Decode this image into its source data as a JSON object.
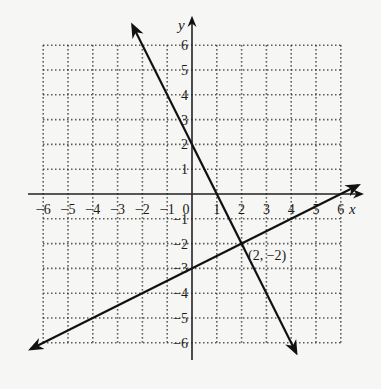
{
  "chart_data": {
    "type": "line",
    "title": "",
    "xlabel": "x",
    "ylabel": "y",
    "xlim": [
      -6,
      6
    ],
    "ylim": [
      -6,
      6
    ],
    "grid": true,
    "grid_style": "dotted",
    "x_ticks": [
      "-6",
      "-5",
      "-4",
      "-3",
      "-2",
      "-1",
      "0",
      "1",
      "2",
      "3",
      "4",
      "5",
      "6"
    ],
    "y_ticks": [
      "-6",
      "-5",
      "-4",
      "-3",
      "-2",
      "-1",
      "1",
      "2",
      "3",
      "4",
      "5",
      "6"
    ],
    "series": [
      {
        "name": "line1",
        "equation": "y = -2x + 2",
        "slope": -2,
        "intercept": 2,
        "x": [
          -1,
          0,
          1,
          2,
          3,
          4
        ],
        "y": [
          4,
          2,
          0,
          -2,
          -4,
          -6
        ]
      },
      {
        "name": "line2",
        "equation": "y = 0.5x - 3",
        "slope": 0.5,
        "intercept": -3,
        "x": [
          -6,
          -4,
          -2,
          0,
          2,
          4,
          6
        ],
        "y": [
          -6,
          -5,
          -4,
          -3,
          -2,
          -1,
          0
        ]
      }
    ],
    "annotations": [
      {
        "text": "(2, −2)",
        "x": 2,
        "y": -2
      }
    ]
  },
  "labels": {
    "x_axis": "x",
    "y_axis": "y",
    "intersection": "(2, −2)",
    "x_ticks": [
      "−6",
      "−5",
      "−4",
      "−3",
      "−2",
      "−1",
      "0",
      "1",
      "2",
      "3",
      "4",
      "5",
      "6"
    ],
    "y_pos_ticks": [
      "1",
      "2",
      "3",
      "4",
      "5",
      "6"
    ],
    "y_neg_ticks": [
      "−1",
      "−2",
      "−3",
      "−4",
      "−5",
      "−6"
    ]
  }
}
